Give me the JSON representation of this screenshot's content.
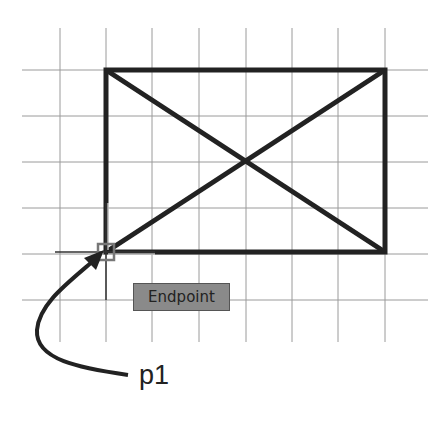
{
  "drawing": {
    "grid": {
      "vertical_x": [
        60,
        106,
        152,
        199,
        246,
        292,
        338,
        385
      ],
      "horizontal_y": [
        70,
        116,
        162,
        208,
        254,
        300
      ],
      "x_range": [
        22,
        428
      ],
      "y_range": [
        28,
        342
      ],
      "color": "#9a9a9a"
    },
    "rectangle": {
      "x1": 106,
      "y1": 70,
      "x2": 385,
      "y2": 252,
      "color": "#222222"
    },
    "diagonals": true
  },
  "snap": {
    "tooltip_label": "Endpoint",
    "marker_point": [
      106,
      252
    ]
  },
  "annotation": {
    "label": "p1"
  }
}
